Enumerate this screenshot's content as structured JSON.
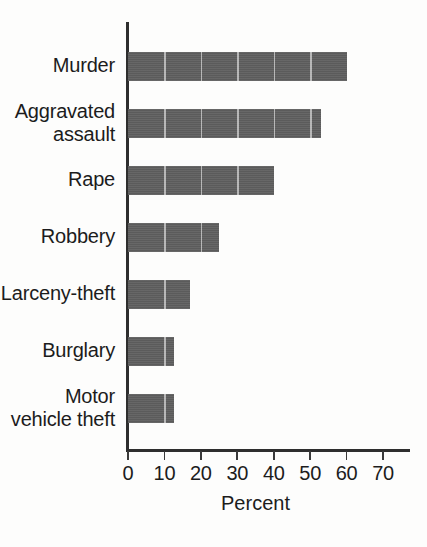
{
  "chart_data": {
    "type": "bar",
    "orientation": "horizontal",
    "title": "",
    "xlabel": "Percent",
    "ylabel": "",
    "categories": [
      "Murder",
      "Aggravated\nassault",
      "Rape",
      "Robbery",
      "Larceny-theft",
      "Burglary",
      "Motor\nvehicle theft"
    ],
    "values": [
      60,
      53,
      40,
      25,
      17,
      12.5,
      12.5
    ],
    "xlim": [
      0,
      70
    ],
    "xticks": [
      0,
      10,
      20,
      30,
      40,
      50,
      60,
      70
    ],
    "xtick_labels": [
      "0",
      "10",
      "20",
      "30",
      "40",
      "50",
      "60",
      "70"
    ],
    "grid": false,
    "legend": null,
    "bar_color": "#5e5e5e",
    "axis_color": "#2e2e2e",
    "background_color": "#fdfdfc"
  }
}
